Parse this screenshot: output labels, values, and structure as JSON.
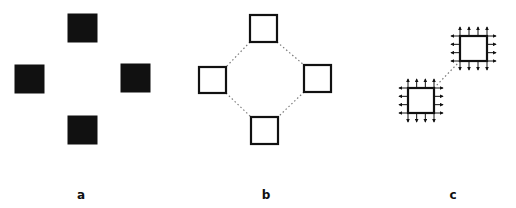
{
  "colors": {
    "ink": "#111111",
    "dotted": "#7a7a7a",
    "background": "#ffffff"
  },
  "panels": [
    {
      "id": "a",
      "label": "a",
      "label_pos": {
        "x": 81,
        "y": 189
      },
      "style": "filled",
      "squares": [
        {
          "x": 68,
          "y": 14,
          "w": 29,
          "h": 28
        },
        {
          "x": 15,
          "y": 65,
          "w": 29,
          "h": 28
        },
        {
          "x": 121,
          "y": 64,
          "w": 29,
          "h": 28
        },
        {
          "x": 68,
          "y": 116,
          "w": 29,
          "h": 28
        }
      ],
      "links": []
    },
    {
      "id": "b",
      "label": "b",
      "label_pos": {
        "x": 266,
        "y": 189
      },
      "style": "outline",
      "squares": [
        {
          "x": 250,
          "y": 15,
          "w": 27,
          "h": 27
        },
        {
          "x": 199,
          "y": 67,
          "w": 27,
          "h": 26
        },
        {
          "x": 304,
          "y": 65,
          "w": 27,
          "h": 27
        },
        {
          "x": 251,
          "y": 117,
          "w": 27,
          "h": 27
        }
      ],
      "links": [
        {
          "x1": 250,
          "y1": 42,
          "x2": 226,
          "y2": 67
        },
        {
          "x1": 277,
          "y1": 42,
          "x2": 304,
          "y2": 65
        },
        {
          "x1": 226,
          "y1": 93,
          "x2": 251,
          "y2": 117
        },
        {
          "x1": 304,
          "y1": 92,
          "x2": 278,
          "y2": 117
        }
      ]
    },
    {
      "id": "c",
      "label": "c",
      "label_pos": {
        "x": 453,
        "y": 189
      },
      "style": "outline-arrows",
      "arrow_length": 9,
      "squares": [
        {
          "x": 460,
          "y": 36,
          "w": 27,
          "h": 25
        },
        {
          "x": 408,
          "y": 88,
          "w": 26,
          "h": 25
        }
      ],
      "links": [
        {
          "x1": 460,
          "y1": 61,
          "x2": 434,
          "y2": 88
        }
      ]
    }
  ]
}
